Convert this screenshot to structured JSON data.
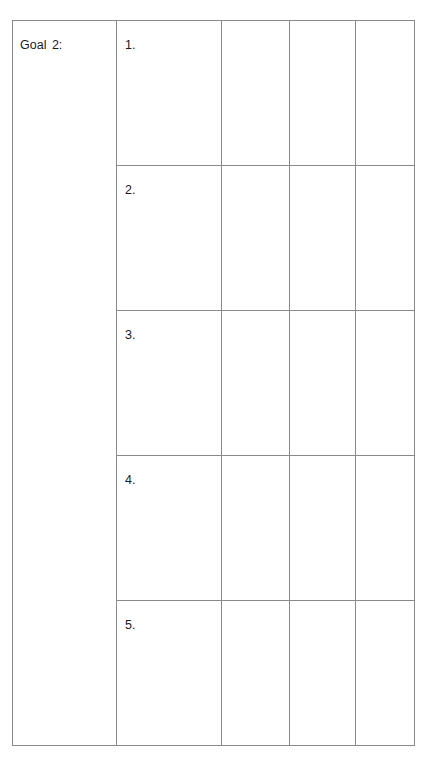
{
  "goal": {
    "label": "Goal 2:"
  },
  "rows": [
    {
      "number": "1."
    },
    {
      "number": "2."
    },
    {
      "number": "3."
    },
    {
      "number": "4."
    },
    {
      "number": "5."
    }
  ]
}
